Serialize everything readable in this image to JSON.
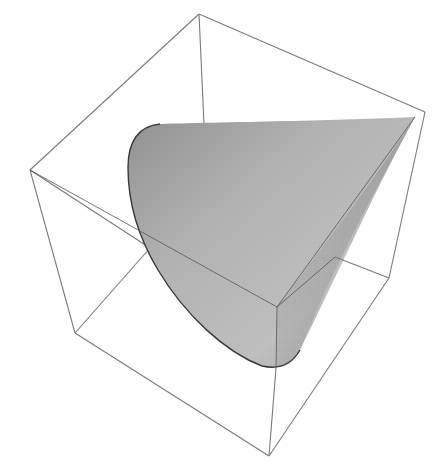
{
  "figure": {
    "box": {
      "vertices": {
        "top": [
          199,
          14
        ],
        "right": [
          425,
          112
        ],
        "left": [
          30,
          170
        ],
        "bottom_left": [
          75,
          333
        ],
        "bottom": [
          269,
          456
        ],
        "bottom_right": [
          389,
          278
        ],
        "front_inner": [
          277,
          307
        ],
        "back_inner_top": [
          204,
          124
        ],
        "back_inner_left": [
          150,
          248
        ]
      },
      "edge_color": "#7a7a7a"
    },
    "cone": {
      "apex": [
        415,
        117
      ],
      "fill_light": "#c4c4c4",
      "fill_dark": "#8e8e8e",
      "rim_color": "#3a3a3a"
    }
  }
}
